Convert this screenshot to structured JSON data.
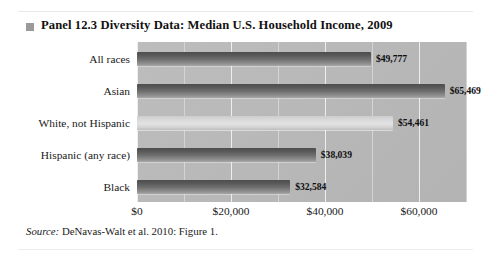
{
  "panel": {
    "bullet_icon": "square-bullet-icon",
    "title": "Panel 12.3  Diversity Data: Median U.S. Household Income, 2009",
    "source_label": "Source:",
    "source_text": " DeNavas-Walt et al. 2010: Figure 1."
  },
  "chart_data": {
    "type": "bar",
    "orientation": "horizontal",
    "title": "Panel 12.3  Diversity Data: Median U.S. Household Income, 2009",
    "xlabel": "",
    "ylabel": "",
    "categories": [
      "All races",
      "Asian",
      "White, not Hispanic",
      "Hispanic (any race)",
      "Black"
    ],
    "values": [
      49777,
      65469,
      54461,
      38039,
      32584
    ],
    "value_labels": [
      "$49,777",
      "$65,469",
      "$54,461",
      "$38,039",
      "$32,584"
    ],
    "bar_styles": [
      "dark",
      "dark",
      "light",
      "dark",
      "dark"
    ],
    "xlim": [
      0,
      70000
    ],
    "xticks": [
      0,
      20000,
      40000,
      60000
    ],
    "xticklabels": [
      "$0",
      "$20,000",
      "$40,000",
      "$60,000"
    ],
    "minor_gridlines": [
      10000,
      30000,
      50000,
      70000
    ],
    "grid": true,
    "legend": "none",
    "plot_background": "#b9b9b9",
    "gridline_color": "#eeeeee",
    "bar_color_dark": "#6e6e6e",
    "bar_color_light": "#dedede",
    "source": "Source: DeNavas-Walt et al. 2010: Figure 1."
  }
}
